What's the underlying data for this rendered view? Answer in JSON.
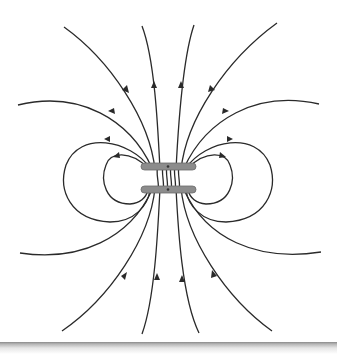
{
  "diagram": {
    "colors": {
      "field_line": "#2a2a2a",
      "coil": "#8c8c8c",
      "background": "#ffffff"
    },
    "elements": {
      "coils": 2,
      "closed_loops_per_side": 2,
      "open_lines_per_side": 2,
      "vertical_lines_top": 4,
      "vertical_lines_bottom": 4
    },
    "field_direction": "upward through coils, returning around the sides"
  }
}
